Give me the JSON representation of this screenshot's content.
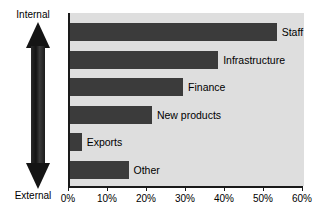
{
  "chart_data": {
    "type": "bar",
    "orientation": "horizontal",
    "title": "",
    "xlabel": "",
    "ylabel": "",
    "categories": [
      "Staff",
      "Infrastructure",
      "Finance",
      "New products",
      "Exports",
      "Other"
    ],
    "values": [
      53,
      38,
      29,
      21,
      3,
      15
    ],
    "value_unit": "%",
    "xlim": [
      0,
      60
    ],
    "xticks": [
      0,
      10,
      20,
      30,
      40,
      50,
      60
    ],
    "xtick_labels": [
      "0%",
      "10%",
      "20%",
      "30%",
      "40%",
      "50%",
      "60%"
    ],
    "grid": false,
    "legend": false,
    "bar_color": "#3b3b3b",
    "plot_background": "#dedede",
    "axis_color": "#1a1a1a",
    "annotations": {
      "vertical_axis_top_label": "Internal",
      "vertical_axis_bottom_label": "External"
    }
  },
  "axis": {
    "internal_label": "Internal",
    "external_label": "External"
  },
  "bars": [
    {
      "label": "Staff",
      "value": 53
    },
    {
      "label": "Infrastructure",
      "value": 38
    },
    {
      "label": "Finance",
      "value": 29
    },
    {
      "label": "New products",
      "value": 21
    },
    {
      "label": "Exports",
      "value": 3
    },
    {
      "label": "Other",
      "value": 15
    }
  ],
  "xticks": [
    {
      "label": "0%",
      "value": 0
    },
    {
      "label": "10%",
      "value": 10
    },
    {
      "label": "20%",
      "value": 20
    },
    {
      "label": "30%",
      "value": 30
    },
    {
      "label": "40%",
      "value": 40
    },
    {
      "label": "50%",
      "value": 50
    },
    {
      "label": "60%",
      "value": 60
    }
  ]
}
